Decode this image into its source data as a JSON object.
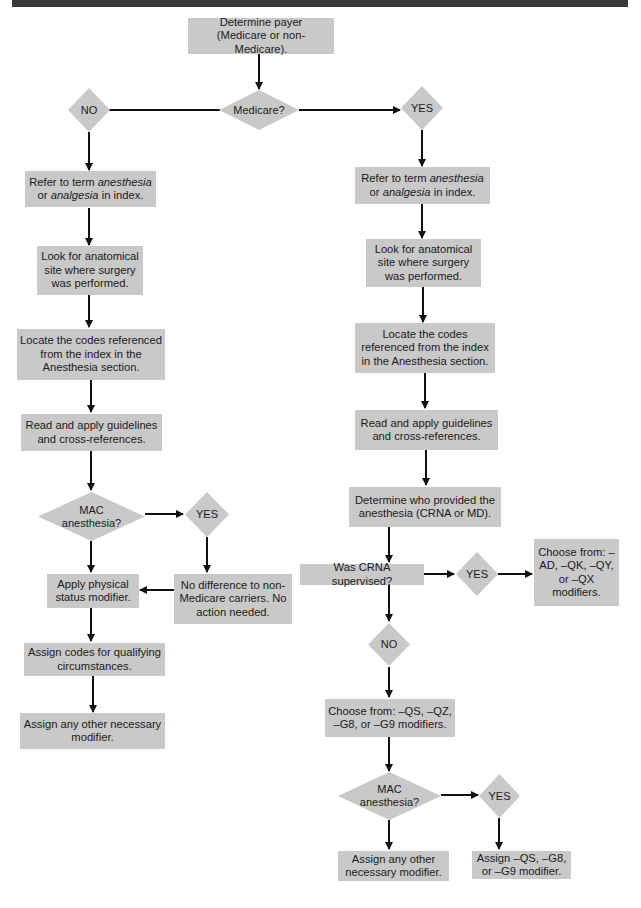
{
  "colors": {
    "box_fill": "#c9c9c9",
    "arrow": "#111111",
    "header_bar": "#3a3a3a"
  },
  "start": {
    "line1": "Determine payer",
    "line2": "(Medicare or non-Medicare)."
  },
  "decision_medicare": "Medicare?",
  "left_branch": {
    "label": "NO",
    "steps": {
      "refer": {
        "pre": "Refer to term ",
        "em1": "anesthesia",
        "mid": "or ",
        "em2": "analgesia",
        "post": " in index."
      },
      "look": "Look for anatomical site where surgery was performed.",
      "locate": "Locate the codes referenced from the index in the Anesthesia section.",
      "read": "Read and apply guidelines and cross-references.",
      "mac_decision": {
        "line1": "MAC",
        "line2": "anesthesia?"
      },
      "mac_yes": "YES",
      "no_difference": "No difference to non-Medicare carriers. No action needed.",
      "apply_physical": "Apply physical status modifier.",
      "assign_codes": "Assign codes for qualifying circumstances.",
      "assign_other": "Assign any other necessary modifier."
    }
  },
  "right_branch": {
    "label": "YES",
    "steps": {
      "refer": {
        "pre": "Refer to term ",
        "em1": "anesthesia",
        "mid": "or ",
        "em2": "analgesia",
        "post": " in index."
      },
      "look": "Look for anatomical site where surgery was performed.",
      "locate": "Locate the codes referenced from the index in the Anesthesia section.",
      "read": "Read and apply guidelines and cross-references.",
      "determine_provider": "Determine who provided the anesthesia (CRNA or MD).",
      "crna_decision": "Was CRNA supervised?",
      "crna_yes": "YES",
      "crna_yes_result": "Choose from: –AD, –QK, –QY, or –QX modifiers.",
      "crna_no": "NO",
      "crna_no_result": "Choose from: –QS, –QZ, –G8, or –G9 modifiers.",
      "mac_decision": {
        "line1": "MAC",
        "line2": "anesthesia?"
      },
      "mac_yes": "YES",
      "assign_other": "Assign any other necessary modifier.",
      "assign_qs": "Assign –QS, –G8, or –G9 modifier."
    }
  }
}
